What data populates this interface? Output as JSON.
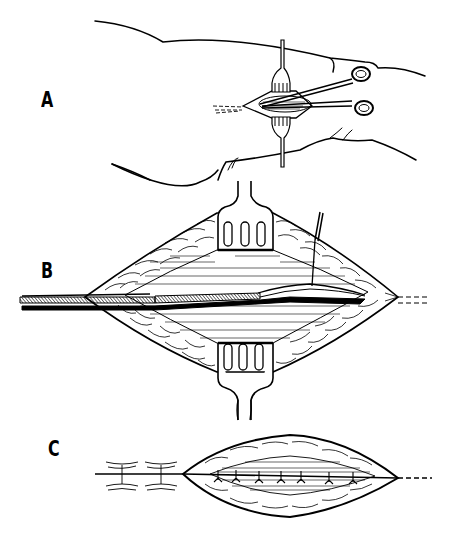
{
  "figure": {
    "type": "surgical-illustration",
    "style": "black line drawing on white",
    "colors": {
      "ink": "#000000",
      "background": "#ffffff"
    },
    "panels": [
      {
        "id": "A",
        "label": "A",
        "description": "Small incision on limb held open by two retractors with scissors inserted"
      },
      {
        "id": "B",
        "label": "B",
        "description": "Enlarged diamond-shaped wound opened by two retractors, probe/director inserted along the tract, tissue lifted by hook"
      },
      {
        "id": "C",
        "label": "C",
        "description": "Wound closed with sutures in layers, interrupted skin sutures to the left, dashed line continuing to the right"
      }
    ]
  }
}
